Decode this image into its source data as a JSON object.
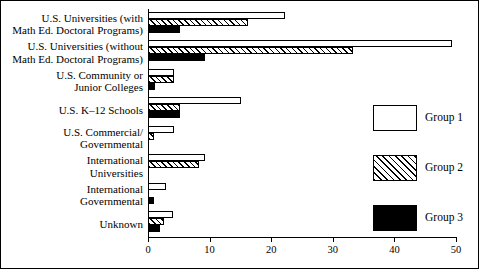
{
  "chart_data": {
    "type": "bar",
    "orientation": "horizontal",
    "title": "",
    "subtitle": "",
    "xlabel": "",
    "ylabel": "",
    "xlim": [
      0,
      50
    ],
    "xticks": [
      0,
      10,
      20,
      30,
      40,
      50
    ],
    "xtick_labels": [
      "0",
      "10",
      "20",
      "30",
      "40",
      "50"
    ],
    "grid": false,
    "legend_position": "right",
    "categories": [
      "U.S. Universities (with\nMath Ed. Doctoral Programs)",
      "U.S. Universities (without\nMath Ed. Doctoral Programs)",
      "U.S. Community or\nJunior Colleges",
      "U.S. K–12 Schools",
      "U.S. Commercial/\nGovernmental",
      "International\nUniversities",
      "International\nGovernmental",
      "Unknown"
    ],
    "category_lines": [
      [
        "U.S. Universities (with",
        "Math Ed. Doctoral Programs)"
      ],
      [
        "U.S. Universities (without",
        "Math Ed. Doctoral Programs)"
      ],
      [
        "U.S. Community or",
        "Junior Colleges"
      ],
      [
        "U.S. K–12 Schools"
      ],
      [
        "U.S. Commercial/",
        "Governmental"
      ],
      [
        "International",
        "Universities"
      ],
      [
        "International",
        "Governmental"
      ],
      [
        "Unknown"
      ]
    ],
    "series": [
      {
        "name": "Group 1",
        "fill": "white",
        "color": "#ffffff",
        "values": [
          22.3,
          49.4,
          4.3,
          15.1,
          4.2,
          9.2,
          3.0,
          4.0
        ]
      },
      {
        "name": "Group 2",
        "fill": "hatched",
        "color": "#ffffff",
        "values": [
          16.3,
          33.3,
          4.3,
          5.2,
          1.0,
          8.2,
          0.0,
          2.6
        ]
      },
      {
        "name": "Group 3",
        "fill": "black",
        "color": "#000000",
        "values": [
          5.2,
          9.2,
          1.2,
          5.2,
          0.0,
          0.0,
          1.0,
          2.0
        ]
      }
    ]
  },
  "legend": {
    "items": [
      {
        "label": "Group 1",
        "fill": "g1"
      },
      {
        "label": "Group 2",
        "fill": "g2"
      },
      {
        "label": "Group 3",
        "fill": "g3"
      }
    ]
  }
}
